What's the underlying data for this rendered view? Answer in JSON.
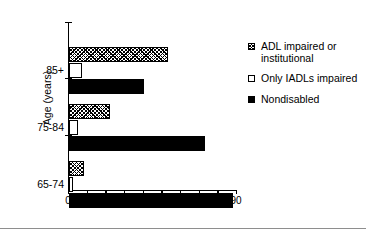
{
  "chart_data": {
    "type": "bar",
    "orientation": "horizontal",
    "title": "",
    "xlabel": "Percent",
    "ylabel": "Age (years)",
    "categories": [
      "65-74",
      "75-84",
      "85+"
    ],
    "xlim": [
      0,
      90
    ],
    "xticks": [
      0,
      10,
      20,
      30,
      40,
      50,
      60,
      70,
      80,
      90
    ],
    "xticklabels": [
      "0",
      "10",
      "20",
      "30",
      "40",
      "50",
      "60",
      "70",
      "80",
      "90"
    ],
    "grid": false,
    "legend_position": "right",
    "series": [
      {
        "name": "ADL impaired or institutional",
        "style": "hatch",
        "values": [
          8,
          22,
          53
        ]
      },
      {
        "name": "Only IADLs impaired",
        "style": "open",
        "values": [
          2,
          5,
          7
        ]
      },
      {
        "name": "Nondisabled",
        "style": "solid",
        "values": [
          88,
          73,
          40
        ]
      }
    ]
  },
  "legend": {
    "items": [
      {
        "label": "ADL impaired or institutional",
        "style": "hatch"
      },
      {
        "label": "Only IADLs impaired",
        "style": "open"
      },
      {
        "label": "Nondisabled",
        "style": "solid"
      }
    ]
  }
}
